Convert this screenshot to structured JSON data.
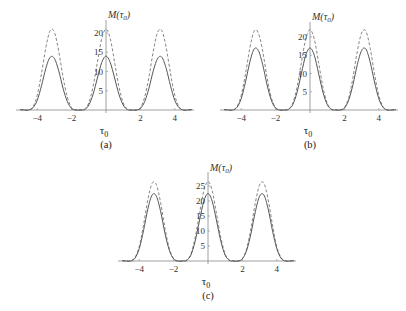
{
  "chart_data": [
    {
      "type": "line",
      "panel": "(a)",
      "xlabel": "τ0",
      "ylabel": "M(τ0)",
      "xticks": [
        -4,
        -2,
        2,
        4
      ],
      "yticks": [
        5,
        10,
        15,
        20
      ],
      "xlim": [
        -5.3,
        5.2
      ],
      "ylim": [
        0,
        21
      ],
      "grid": false,
      "x": [
        -5,
        -4.75,
        -4.5,
        -4.25,
        -4,
        -3.75,
        -3.5,
        -3.25,
        -3,
        -2.75,
        -2.5,
        -2.25,
        -2,
        -1.75,
        -1.5,
        -1.25,
        -1,
        -0.75,
        -0.5,
        -0.25,
        0,
        0.25,
        0.5,
        0.75,
        1,
        1.25,
        1.5,
        1.75,
        2,
        2.25,
        2.5,
        2.75,
        3,
        3.25,
        3.5,
        3.75,
        4,
        4.25,
        4.5,
        4.75,
        5
      ],
      "series": [
        {
          "name": "solid",
          "style": "solid",
          "values": [
            0.1,
            0,
            0,
            0.6,
            2.5,
            6.3,
            10.8,
            13.7,
            13.4,
            10.2,
            5.7,
            2.2,
            0.4,
            0,
            0,
            0.1,
            1.3,
            4.1,
            8.3,
            12.3,
            14,
            12.3,
            8.3,
            4.1,
            1.3,
            0.1,
            0,
            0,
            0.4,
            2.2,
            5.7,
            10.2,
            13.4,
            13.7,
            10.8,
            6.3,
            2.5,
            0.6,
            0,
            0,
            0.1
          ]
        },
        {
          "name": "dashed",
          "style": "dashed",
          "values": [
            0.1,
            0,
            0,
            0.8,
            3.8,
            9.5,
            16.2,
            20.6,
            20.2,
            15.3,
            8.6,
            3.4,
            0.6,
            0,
            0,
            0.2,
            1.9,
            6.1,
            12.4,
            18.5,
            21,
            18.5,
            12.4,
            6.1,
            1.9,
            0.2,
            0,
            0,
            0.6,
            3.4,
            8.6,
            15.3,
            20.2,
            20.6,
            16.2,
            9.5,
            3.8,
            0.8,
            0,
            0,
            0.1
          ]
        }
      ]
    },
    {
      "type": "line",
      "panel": "(b)",
      "xlabel": "τ0",
      "ylabel": "M(τ0)",
      "xticks": [
        -4,
        -2,
        2,
        4
      ],
      "yticks": [
        5,
        10,
        15,
        20
      ],
      "xlim": [
        -5.3,
        5.2
      ],
      "ylim": [
        0,
        22
      ],
      "grid": false,
      "x": [
        -5,
        -4.75,
        -4.5,
        -4.25,
        -4,
        -3.75,
        -3.5,
        -3.25,
        -3,
        -2.75,
        -2.5,
        -2.25,
        -2,
        -1.75,
        -1.5,
        -1.25,
        -1,
        -0.75,
        -0.5,
        -0.25,
        0,
        0.25,
        0.5,
        0.75,
        1,
        1.25,
        1.5,
        1.75,
        2,
        2.25,
        2.5,
        2.75,
        3,
        3.25,
        3.5,
        3.75,
        4,
        4.25,
        4.5,
        4.75,
        5
      ],
      "series": [
        {
          "name": "solid",
          "style": "solid",
          "values": [
            0.1,
            0,
            0,
            0.7,
            3.1,
            7.7,
            13.1,
            16.7,
            16.3,
            12.4,
            7,
            2.7,
            0.5,
            0,
            0,
            0.2,
            1.5,
            4.9,
            10,
            15,
            17,
            15,
            10,
            4.9,
            1.5,
            0.2,
            0,
            0,
            0.5,
            2.7,
            7,
            12.4,
            16.3,
            16.7,
            13.1,
            7.7,
            3.1,
            0.7,
            0,
            0,
            0.1
          ]
        },
        {
          "name": "dashed",
          "style": "dashed",
          "values": [
            0.1,
            0,
            0,
            0.9,
            4,
            9.9,
            16.9,
            21.6,
            21.1,
            16.1,
            9,
            3.4,
            0.7,
            0,
            0,
            0.2,
            1.9,
            6.3,
            13,
            19.4,
            22,
            19.4,
            13,
            6.3,
            1.9,
            0.2,
            0,
            0,
            0.7,
            3.4,
            9,
            16.1,
            21.1,
            21.6,
            16.9,
            9.9,
            4,
            0.9,
            0,
            0,
            0.1
          ]
        }
      ]
    },
    {
      "type": "line",
      "panel": "(c)",
      "xlabel": "τ0",
      "ylabel": "M(τ0)",
      "xticks": [
        -4,
        -2,
        2,
        4
      ],
      "yticks": [
        5,
        10,
        15,
        20,
        25
      ],
      "xlim": [
        -5.3,
        5.2
      ],
      "ylim": [
        0,
        27
      ],
      "grid": false,
      "x": [
        -5,
        -4.75,
        -4.5,
        -4.25,
        -4,
        -3.75,
        -3.5,
        -3.25,
        -3,
        -2.75,
        -2.5,
        -2.25,
        -2,
        -1.75,
        -1.5,
        -1.25,
        -1,
        -0.75,
        -0.5,
        -0.25,
        0,
        0.25,
        0.5,
        0.75,
        1,
        1.25,
        1.5,
        1.75,
        2,
        2.25,
        2.5,
        2.75,
        3,
        3.25,
        3.5,
        3.75,
        4,
        4.25,
        4.5,
        4.75,
        5
      ],
      "series": [
        {
          "name": "solid",
          "style": "solid",
          "values": [
            0.1,
            0,
            0,
            0.9,
            4.1,
            10.1,
            17.3,
            22,
            21.6,
            16.4,
            9.2,
            3.6,
            0.7,
            0,
            0,
            0.2,
            1.9,
            6.5,
            13.3,
            19.8,
            22.5,
            19.8,
            13.3,
            6.5,
            1.9,
            0.2,
            0,
            0,
            0.7,
            3.6,
            9.2,
            16.4,
            21.6,
            22,
            17.3,
            10.1,
            4.1,
            0.9,
            0,
            0,
            0.1
          ]
        },
        {
          "name": "dashed",
          "style": "dashed",
          "values": [
            0.2,
            0,
            0.1,
            1.1,
            4.8,
            12,
            20.4,
            25.9,
            25.4,
            19.3,
            10.9,
            4.2,
            0.8,
            0,
            0,
            0.3,
            2.3,
            7.7,
            15.6,
            23.3,
            26.5,
            23.3,
            15.6,
            7.7,
            2.3,
            0.3,
            0,
            0,
            0.8,
            4.2,
            10.9,
            19.3,
            25.4,
            25.9,
            20.4,
            12,
            4.8,
            1.1,
            0.1,
            0,
            0.2
          ]
        }
      ]
    }
  ],
  "panels": [
    {
      "caption": "(a)",
      "xlabel": "τ",
      "xlabel_sub": "0",
      "ylabel": "M(τ",
      "ylabel_sub": "0",
      "ylabel_close": ")",
      "xtick_labels": [
        "−4",
        "−2",
        "2",
        "4"
      ],
      "ytick_labels": [
        "5",
        "10",
        "15",
        "20"
      ]
    },
    {
      "caption": "(b)",
      "xlabel": "τ",
      "xlabel_sub": "0",
      "ylabel": "M(τ",
      "ylabel_sub": "0",
      "ylabel_close": ")",
      "xtick_labels": [
        "−4",
        "−2",
        "2",
        "4"
      ],
      "ytick_labels": [
        "5",
        "10",
        "15",
        "20"
      ]
    },
    {
      "caption": "(c)",
      "xlabel": "τ",
      "xlabel_sub": "0",
      "ylabel": "M(τ",
      "ylabel_sub": "0",
      "ylabel_close": ")",
      "xtick_labels": [
        "−4",
        "−2",
        "2",
        "4"
      ],
      "ytick_labels": [
        "5",
        "10",
        "15",
        "20",
        "25"
      ]
    }
  ],
  "colors": {
    "solid": "#555555",
    "dashed": "#777777",
    "axis": "#888888"
  }
}
